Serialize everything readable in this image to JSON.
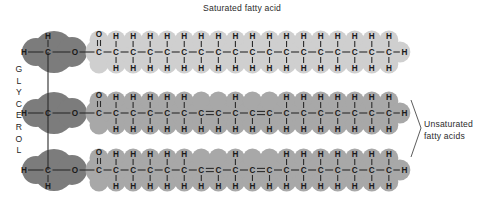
{
  "figure": {
    "kind": "triglyceride-molecular-structure",
    "background": "#ffffff",
    "width": 501,
    "height": 208
  },
  "labels": {
    "saturated_title": "Saturated fatty acid",
    "unsaturated_line1": "Unsaturated",
    "unsaturated_line2": "fatty acids",
    "glycerol_letters": [
      "G",
      "L",
      "Y",
      "C",
      "E",
      "R",
      "O",
      "L"
    ]
  },
  "colors": {
    "glycerol_blob": "#7c7c7c",
    "saturated_blob": "#cfcfcf",
    "unsaturated_blob": "#a8a8a8",
    "bond": "#2b2b2b",
    "atom_text": "#1a1a1a",
    "label_text": "#2b2b2b",
    "leader_line": "#4a4a4a",
    "page": "#ffffff"
  },
  "geometry": {
    "chain_start_x": 99,
    "carbon_spacing": 17.05,
    "row_y": [
      52,
      113,
      170
    ],
    "glycerol_c_x": 48,
    "glycerol_o_x": 75,
    "glycerol_h_x": 24,
    "blob_radius_glycerol": 21,
    "blob_radius_chain": 13.5
  },
  "atoms": {
    "carbon": "C",
    "hydrogen": "H",
    "oxygen": "O"
  },
  "glycerol": {
    "rows": [
      {
        "index": 0,
        "h_left": "H",
        "c": "C",
        "o": "O",
        "h_vertical": "H",
        "h_vertical_side": "top"
      },
      {
        "index": 1,
        "h_left": "H",
        "c": "C",
        "o": "O",
        "h_vertical": null,
        "h_vertical_side": null
      },
      {
        "index": 2,
        "h_left": "H",
        "c": "C",
        "o": "O",
        "h_vertical": "H",
        "h_vertical_side": "bottom"
      }
    ]
  },
  "chains": [
    {
      "name": "saturated-fatty-acid",
      "row": 0,
      "saturated": true,
      "carbons": 18,
      "carbonyl_oxygen": "O",
      "terminal_hydrogen": "H",
      "double_bonds": [],
      "blob_color": "#cfcfcf"
    },
    {
      "name": "unsaturated-fatty-acid-1",
      "row": 1,
      "saturated": false,
      "carbons": 18,
      "carbonyl_oxygen": "O",
      "terminal_hydrogen": "H",
      "double_bonds": [
        [
          6,
          7
        ],
        [
          9,
          10
        ]
      ],
      "blob_color": "#a8a8a8"
    },
    {
      "name": "unsaturated-fatty-acid-2",
      "row": 2,
      "saturated": false,
      "carbons": 18,
      "carbonyl_oxygen": "O",
      "terminal_hydrogen": "H",
      "double_bonds": [
        [
          6,
          7
        ],
        [
          9,
          10
        ]
      ],
      "blob_color": "#a8a8a8"
    }
  ]
}
